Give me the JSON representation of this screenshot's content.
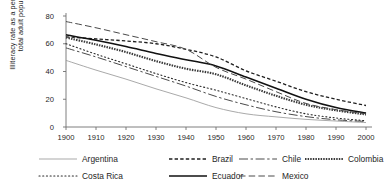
{
  "chart_data": {
    "type": "line",
    "title": "",
    "xlabel": "",
    "ylabel": "Illiteracy rate as a percentage of total adult population",
    "ylabel_line1": "Illiteracy rate as a percentage of",
    "ylabel_line2": "total adult population",
    "xlim": [
      1900,
      2000
    ],
    "ylim": [
      0,
      80
    ],
    "yticks": [
      0,
      20,
      40,
      60,
      80
    ],
    "xticks": [
      1900,
      1910,
      1920,
      1930,
      1940,
      1950,
      1960,
      1970,
      1980,
      1990,
      2000
    ],
    "grid": false,
    "legend_position": "bottom",
    "x": [
      1900,
      1910,
      1920,
      1930,
      1940,
      1950,
      1960,
      1970,
      1980,
      1990,
      2000
    ],
    "series": [
      {
        "name": "Argentina",
        "style": "solid-thin",
        "color": "#999999",
        "values": [
          48.0,
          41.0,
          34.5,
          27.5,
          21.0,
          14.0,
          9.5,
          7.3,
          5.5,
          4.3,
          3.2
        ]
      },
      {
        "name": "Brazil",
        "style": "dashed-dotted",
        "color": "#1f1f1f",
        "values": [
          65.0,
          63.5,
          62.0,
          60.0,
          56.0,
          50.5,
          40.5,
          33.0,
          25.5,
          20.0,
          15.5
        ]
      },
      {
        "name": "Chile",
        "style": "dash-dot",
        "color": "#4a4a4a",
        "values": [
          57.0,
          50.5,
          43.5,
          36.5,
          29.5,
          22.0,
          16.0,
          11.0,
          7.5,
          5.2,
          4.0
        ]
      },
      {
        "name": "Colombia",
        "style": "thick-dotted",
        "color": "#3a3a3a",
        "values": [
          64.5,
          59.5,
          54.0,
          47.5,
          42.0,
          38.0,
          30.0,
          22.5,
          16.0,
          12.0,
          9.0
        ]
      },
      {
        "name": "Costa Rica",
        "style": "fine-dotted",
        "color": "#2a2a2a",
        "values": [
          60.0,
          52.5,
          45.5,
          38.5,
          32.0,
          26.5,
          20.5,
          14.5,
          9.5,
          6.5,
          4.5
        ]
      },
      {
        "name": "Ecuador",
        "style": "solid-bold",
        "color": "#111111",
        "values": [
          66.5,
          62.5,
          58.0,
          53.0,
          48.5,
          44.0,
          36.0,
          28.0,
          20.0,
          14.0,
          10.0
        ]
      },
      {
        "name": "Mexico",
        "style": "long-dash",
        "color": "#4a4a4a",
        "values": [
          76.0,
          71.5,
          66.5,
          61.5,
          56.0,
          43.0,
          34.5,
          25.5,
          17.0,
          12.5,
          9.5
        ]
      }
    ],
    "legend": [
      {
        "label": "Argentina",
        "style": "solid-thin",
        "color": "#999999"
      },
      {
        "label": "Brazil",
        "style": "dashed-dotted",
        "color": "#1f1f1f"
      },
      {
        "label": "Chile",
        "style": "dash-dot",
        "color": "#4a4a4a"
      },
      {
        "label": "Colombia",
        "style": "thick-dotted",
        "color": "#3a3a3a"
      },
      {
        "label": "Costa Rica",
        "style": "fine-dotted",
        "color": "#2a2a2a"
      },
      {
        "label": "Ecuador",
        "style": "solid-bold",
        "color": "#111111"
      },
      {
        "label": "Mexico",
        "style": "long-dash",
        "color": "#4a4a4a"
      }
    ]
  },
  "axis": {
    "color": "#6f6f6f"
  }
}
